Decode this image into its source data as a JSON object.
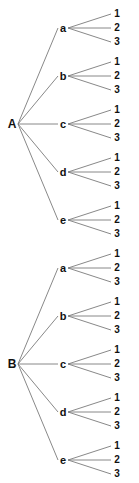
{
  "diagram": {
    "type": "tree",
    "line_color": "#7a7a7a",
    "text_color": "#111111",
    "trees": [
      {
        "root": "A",
        "root_y": 124,
        "children": [
          {
            "label": "a",
            "leaves": [
              "1",
              "2",
              "3"
            ]
          },
          {
            "label": "b",
            "leaves": [
              "1",
              "2",
              "3"
            ]
          },
          {
            "label": "c",
            "leaves": [
              "1",
              "2",
              "3"
            ]
          },
          {
            "label": "d",
            "leaves": [
              "1",
              "2",
              "3"
            ]
          },
          {
            "label": "e",
            "leaves": [
              "1",
              "2",
              "3"
            ]
          }
        ]
      },
      {
        "root": "B",
        "root_y": 364,
        "children": [
          {
            "label": "a",
            "leaves": [
              "1",
              "2",
              "3"
            ]
          },
          {
            "label": "b",
            "leaves": [
              "1",
              "2",
              "3"
            ]
          },
          {
            "label": "c",
            "leaves": [
              "1",
              "2",
              "3"
            ]
          },
          {
            "label": "d",
            "leaves": [
              "1",
              "2",
              "3"
            ]
          },
          {
            "label": "e",
            "leaves": [
              "1",
              "2",
              "3"
            ]
          }
        ]
      }
    ]
  }
}
